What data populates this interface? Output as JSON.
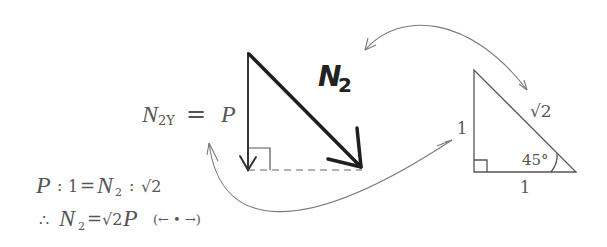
{
  "diagram": {
    "force_label": {
      "main": "N",
      "sub": "2"
    },
    "component_label": {
      "main": "N",
      "sub": "2Y",
      "eq": "=",
      "rhs": "P"
    },
    "triangle": {
      "left_side": "1",
      "bottom_side": "1",
      "hypotenuse": "√2",
      "angle": "45°"
    },
    "equations": {
      "line1": {
        "P": "P",
        "colon1": ":",
        "one": "1",
        "eq": "=",
        "N": "N",
        "sub": "2",
        "colon2": ":",
        "sqrt2": "√2"
      },
      "line2": {
        "therefore": "∴",
        "N": "N",
        "sub": "2",
        "eq": "=",
        "sqrt2": "√2",
        "P": "P",
        "note": "(← • →)"
      }
    },
    "colors": {
      "force_stroke": "#222222",
      "thin_stroke": "#555555",
      "curve_stroke": "#777777",
      "text": "#555555"
    }
  }
}
